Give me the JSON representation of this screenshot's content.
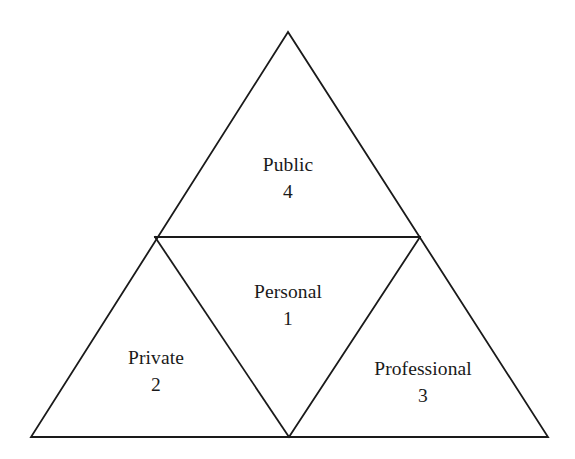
{
  "diagram": {
    "type": "nested-triangle",
    "background_color": "#ffffff",
    "line_color": "#1a1a1a",
    "line_width": 1.8,
    "outer_triangle": {
      "apex": [
        288,
        32
      ],
      "bottom_left": [
        31,
        437
      ],
      "bottom_right": [
        548,
        437
      ]
    },
    "inner_triangle": {
      "left_midpoint": [
        155,
        237
      ],
      "right_midpoint": [
        420,
        237
      ],
      "bottom_midpoint": [
        289,
        437
      ]
    },
    "zones": [
      {
        "id": "public",
        "name": "Public",
        "number": "4",
        "position": "top",
        "center": [
          288,
          178
        ]
      },
      {
        "id": "personal",
        "name": "Personal",
        "number": "1",
        "position": "center",
        "center": [
          288,
          305
        ]
      },
      {
        "id": "private",
        "name": "Private",
        "number": "2",
        "position": "bottom-left",
        "center": [
          156,
          371
        ]
      },
      {
        "id": "professional",
        "name": "Professional",
        "number": "3",
        "position": "bottom-right",
        "center": [
          423,
          382
        ]
      }
    ]
  }
}
